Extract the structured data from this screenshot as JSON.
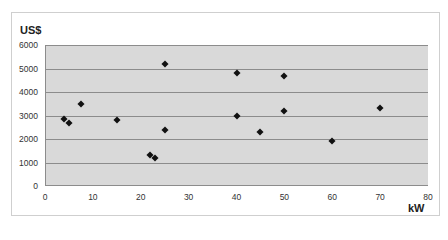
{
  "chart_data": {
    "type": "scatter",
    "title": "",
    "xlabel": "kW",
    "ylabel": "US$",
    "xlim": [
      0,
      80
    ],
    "ylim": [
      0,
      6000
    ],
    "x_ticks": [
      0,
      10,
      20,
      30,
      40,
      50,
      60,
      70,
      80
    ],
    "y_ticks": [
      0,
      1000,
      2000,
      3000,
      4000,
      5000,
      6000
    ],
    "grid": "horizontal",
    "legend": null,
    "marker": "diamond",
    "series": [
      {
        "name": "",
        "points": [
          {
            "x": 4,
            "y": 2850
          },
          {
            "x": 5,
            "y": 2700
          },
          {
            "x": 7.5,
            "y": 3500
          },
          {
            "x": 15,
            "y": 2800
          },
          {
            "x": 22,
            "y": 1300
          },
          {
            "x": 23,
            "y": 1200
          },
          {
            "x": 25,
            "y": 5200
          },
          {
            "x": 25,
            "y": 2400
          },
          {
            "x": 40,
            "y": 4800
          },
          {
            "x": 40,
            "y": 3000
          },
          {
            "x": 45,
            "y": 2300
          },
          {
            "x": 50,
            "y": 4700
          },
          {
            "x": 50,
            "y": 3200
          },
          {
            "x": 60,
            "y": 1900
          },
          {
            "x": 70,
            "y": 3300
          }
        ]
      }
    ]
  },
  "colors": {
    "plot_background": "#d9d9d9",
    "gridline": "#8c8c8c",
    "marker": "#111111",
    "frame_border": "#cfcfcf"
  }
}
